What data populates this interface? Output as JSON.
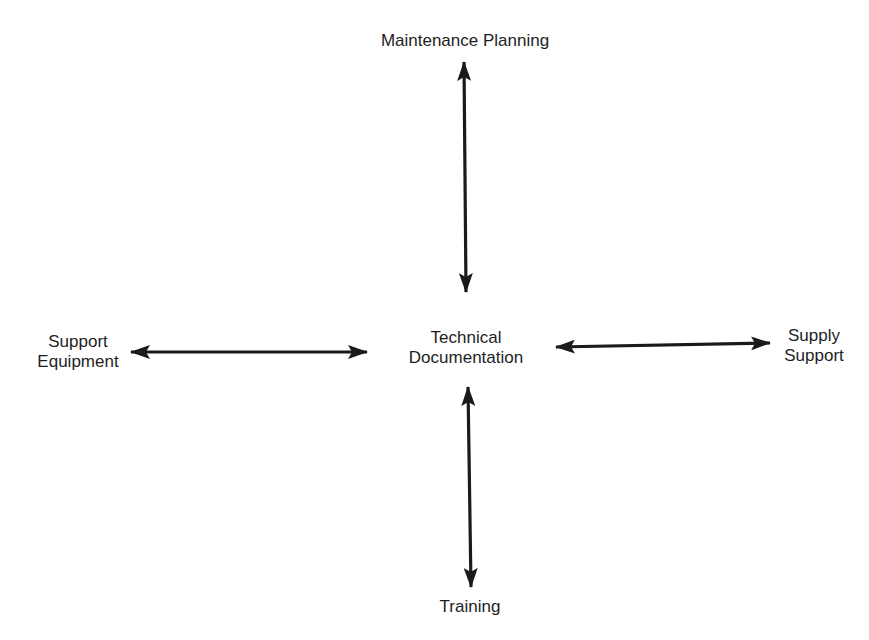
{
  "diagram": {
    "type": "hub-and-spoke",
    "center": {
      "lines": [
        "Technical",
        "Documentation"
      ]
    },
    "nodes": {
      "top": {
        "lines": [
          "Maintenance Planning"
        ]
      },
      "left": {
        "lines": [
          "Support",
          "Equipment"
        ]
      },
      "right": {
        "lines": [
          "Supply",
          "Support"
        ]
      },
      "bottom": {
        "lines": [
          "Training"
        ]
      }
    },
    "connections": [
      {
        "from": "Technical Documentation",
        "to": "Maintenance Planning",
        "style": "double-headed arrow"
      },
      {
        "from": "Technical Documentation",
        "to": "Support Equipment",
        "style": "double-headed arrow"
      },
      {
        "from": "Technical Documentation",
        "to": "Supply Support",
        "style": "double-headed arrow"
      },
      {
        "from": "Technical Documentation",
        "to": "Training",
        "style": "double-headed arrow"
      }
    ],
    "colors": {
      "background": "#ffffff",
      "arrow": "#1a1a1a",
      "text": "#1e1e1e"
    }
  }
}
